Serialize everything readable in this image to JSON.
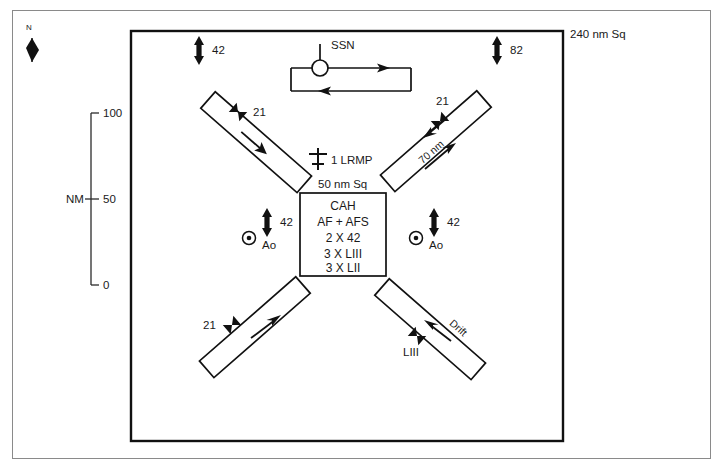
{
  "figure": {
    "type": "tactical-operations-area-diagram",
    "outer_frame": {
      "name": "page-border"
    },
    "operating_area": {
      "label": "240 nm Sq",
      "label_name": "outer-area-label"
    },
    "north_arrow": {
      "label": "N",
      "icon": "north-arrow-icon"
    },
    "scale": {
      "axis_label": "NM",
      "ticks": [
        {
          "value": "100"
        },
        {
          "value": "50"
        },
        {
          "value": "0"
        }
      ]
    },
    "center_box": {
      "area_label": "50 nm Sq",
      "lines": [
        "CAH",
        "AF + AFS",
        "2 X 42",
        "3 X LIII",
        "3 X LII"
      ]
    },
    "lrmp": {
      "count_label": "1 LRMP",
      "icon": "aircraft-lrmp-icon"
    },
    "ssn": {
      "label": "SSN",
      "icon": "submarine-periscope-icon",
      "track_name": "ssn-patrol-track"
    },
    "helo_markers": [
      {
        "name": "helo-marker-top",
        "count": "42",
        "icon": "vertical-double-arrow-icon"
      },
      {
        "name": "helo-marker-top-right",
        "count": "82",
        "icon": "vertical-double-arrow-icon"
      },
      {
        "name": "helo-marker-center-left",
        "count": "42",
        "icon": "vertical-double-arrow-icon"
      },
      {
        "name": "helo-marker-center-right",
        "count": "42",
        "icon": "vertical-double-arrow-icon"
      }
    ],
    "ao_markers": [
      {
        "name": "ao-marker-left",
        "label": "Ao",
        "icon": "circle-dot-icon"
      },
      {
        "name": "ao-marker-right",
        "label": "Ao",
        "icon": "circle-dot-icon"
      }
    ],
    "barriers": [
      {
        "name": "barrier-upper-left",
        "marker_label": "21",
        "marker_icon": "bowtie-marker-icon",
        "leg_label": ""
      },
      {
        "name": "barrier-upper-right",
        "marker_label": "21",
        "marker_icon": "bowtie-marker-icon",
        "leg_label": "70 nm"
      },
      {
        "name": "barrier-lower-left",
        "marker_label": "21",
        "marker_icon": "bowtie-marker-icon",
        "leg_label": ""
      },
      {
        "name": "barrier-lower-right",
        "marker_label": "LIII",
        "marker_icon": "bowtie-marker-icon",
        "leg_label": "Drift"
      }
    ],
    "colors": {
      "ink": "#111111",
      "frame": "#8a8a8a",
      "background": "#ffffff"
    }
  }
}
